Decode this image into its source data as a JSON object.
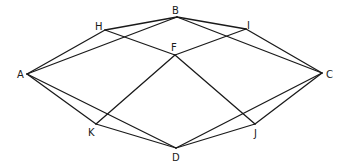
{
  "diagram": {
    "type": "graph",
    "points": [
      {
        "id": "A",
        "label": "A",
        "x": 27,
        "y": 74,
        "lx": 17,
        "ly": 78
      },
      {
        "id": "B",
        "label": "B",
        "x": 177,
        "y": 17,
        "lx": 172,
        "ly": 14
      },
      {
        "id": "C",
        "label": "C",
        "x": 322,
        "y": 73,
        "lx": 326,
        "ly": 78
      },
      {
        "id": "D",
        "label": "D",
        "x": 176,
        "y": 148,
        "lx": 172,
        "ly": 161
      },
      {
        "id": "F",
        "label": "F",
        "x": 175,
        "y": 55,
        "lx": 171,
        "ly": 51
      },
      {
        "id": "H",
        "label": "H",
        "x": 105,
        "y": 30,
        "lx": 95,
        "ly": 30
      },
      {
        "id": "I",
        "label": "I",
        "x": 246,
        "y": 29,
        "lx": 247,
        "ly": 29
      },
      {
        "id": "J",
        "label": "J",
        "x": 255,
        "y": 124,
        "lx": 254,
        "ly": 137
      },
      {
        "id": "K",
        "label": "K",
        "x": 96,
        "y": 124,
        "lx": 88,
        "ly": 136
      }
    ],
    "edges": [
      [
        "A",
        "H"
      ],
      [
        "A",
        "B"
      ],
      [
        "A",
        "K"
      ],
      [
        "A",
        "D"
      ],
      [
        "H",
        "B"
      ],
      [
        "H",
        "F"
      ],
      [
        "B",
        "I"
      ],
      [
        "B",
        "C"
      ],
      [
        "I",
        "F"
      ],
      [
        "I",
        "C"
      ],
      [
        "F",
        "K"
      ],
      [
        "F",
        "J"
      ],
      [
        "K",
        "D"
      ],
      [
        "J",
        "D"
      ],
      [
        "J",
        "C"
      ],
      [
        "D",
        "C"
      ]
    ]
  }
}
